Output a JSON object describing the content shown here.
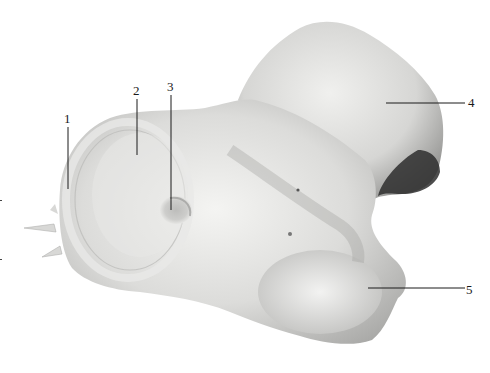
{
  "figure": {
    "type": "anatomical-photograph",
    "colors": {
      "background": "#ffffff",
      "specimen_light": "#f2f2f0",
      "specimen_mid": "#cfcfcc",
      "specimen_dark": "#8a8a88",
      "shadow": "#2a2a2a",
      "leader": "#1a1a1a"
    },
    "labels": [
      {
        "id": "1",
        "text": "1"
      },
      {
        "id": "2",
        "text": "2"
      },
      {
        "id": "3",
        "text": "3"
      },
      {
        "id": "4",
        "text": "4"
      },
      {
        "id": "5",
        "text": "5"
      }
    ]
  }
}
